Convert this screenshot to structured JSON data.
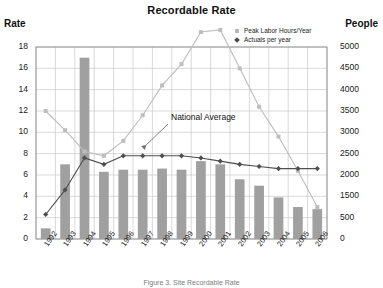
{
  "chart_data": {
    "type": "bar",
    "title": "Recordable Rate",
    "xlabel": "",
    "ylabel": "Rate",
    "y2label": "People",
    "categories": [
      "1992",
      "1993",
      "1994",
      "1995",
      "1996",
      "1997",
      "1998",
      "1999",
      "2000",
      "2001",
      "2002",
      "2003",
      "2004",
      "2005",
      "2006"
    ],
    "ylim": [
      0,
      18
    ],
    "y2lim": [
      0,
      4500
    ],
    "yticks": [
      0,
      2,
      4,
      6,
      8,
      10,
      12,
      14,
      16,
      18
    ],
    "y2ticks_labels": [
      "0",
      "500",
      "1500",
      "2000",
      "2500",
      "3000",
      "3500",
      "4000",
      "4500",
      "5000"
    ],
    "grid": true,
    "legend_position": "top-right",
    "series": [
      {
        "name": "Recordable Rate",
        "type": "bar",
        "axis": "left",
        "color": "#a0a0a0",
        "values": [
          1.0,
          7.0,
          17.0,
          6.3,
          6.5,
          6.5,
          6.6,
          6.5,
          7.3,
          7.0,
          5.6,
          5.0,
          3.9,
          3.0,
          2.8
        ]
      },
      {
        "name": "Peak Labor Hours/Year",
        "type": "line",
        "axis": "right",
        "marker": "square",
        "color": "#bdbdbd",
        "values": [
          3000,
          2550,
          2050,
          1950,
          2300,
          2900,
          3600,
          4100,
          4850,
          4900,
          4000,
          3100,
          2400,
          1600,
          750
        ]
      },
      {
        "name": "Actuals per year",
        "type": "line",
        "axis": "left",
        "marker": "diamond",
        "color": "#4f4f4f",
        "values": [
          2.3,
          4.6,
          7.6,
          7.0,
          7.8,
          7.8,
          7.8,
          7.8,
          7.6,
          7.3,
          7.0,
          6.8,
          6.6,
          6.6,
          6.6
        ]
      }
    ],
    "annotations": [
      {
        "text": "National Average",
        "x": 1999,
        "y": 11.4
      }
    ]
  },
  "legend": {
    "items": [
      {
        "label": "Peak Labor Hours/Year",
        "marker": "square-marker-icon"
      },
      {
        "label": "Actuals per year",
        "marker": "diamond-marker-icon"
      }
    ]
  },
  "caption": {
    "text": "Figure 3.  Site Recordable Rate"
  }
}
